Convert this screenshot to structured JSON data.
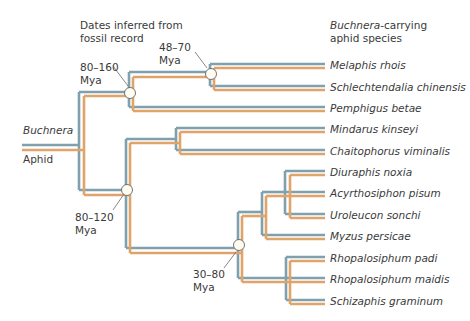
{
  "colors": {
    "host_line": "#7fa0ad",
    "symbiont_line": "#e0a46a",
    "node_fill": "#fffdf2",
    "node_stroke": "#666666",
    "text": "#3a3a3a"
  },
  "headers": {
    "dates_line1": "Dates inferred from",
    "dates_line2": "fossil record",
    "species_italic": "Buchnera",
    "species_rest": "-carrying",
    "species_line2": "aphid species"
  },
  "legend": {
    "symbiont": "Buchnera",
    "host": "Aphid"
  },
  "nodes": [
    {
      "id": "n1",
      "range": "80–160",
      "unit": "Mya"
    },
    {
      "id": "n2",
      "range": "48–70",
      "unit": "Mya"
    },
    {
      "id": "n3",
      "range": "80–120",
      "unit": "Mya"
    },
    {
      "id": "n4",
      "range": "30–80",
      "unit": "Mya"
    }
  ],
  "species": [
    "Melaphis rhois",
    "Schlechtendalia chinensis",
    "Pemphigus betae",
    "Mindarus kinseyi",
    "Chaitophorus viminalis",
    "Diuraphis noxia",
    "Acyrthosiphon pisum",
    "Uroleucon sonchi",
    "Myzus persicae",
    "Rhopalosiphum padi",
    "Rhopalosiphum maidis",
    "Schizaphis graminum"
  ]
}
